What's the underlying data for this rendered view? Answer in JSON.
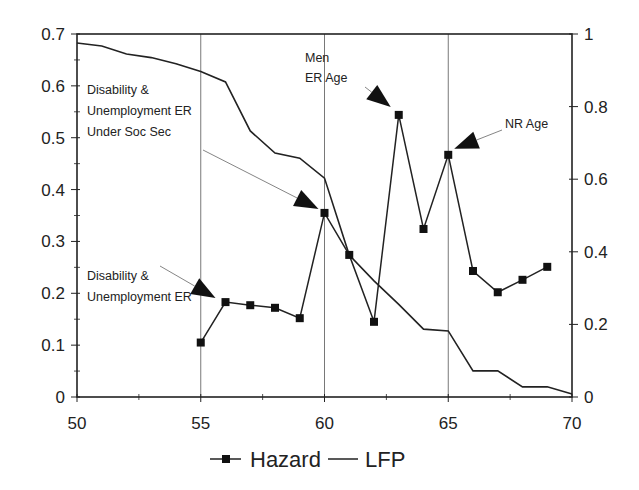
{
  "chart_data": {
    "type": "line",
    "title": "",
    "xlabel": "",
    "ylabel": "",
    "y2label": "",
    "xlim": [
      50,
      70
    ],
    "ylim": [
      0,
      0.7
    ],
    "y2lim": [
      0,
      1
    ],
    "grid": "vertical lines at 55, 60, 65",
    "x_ticks": [
      50,
      55,
      60,
      65,
      70
    ],
    "y_ticks": [
      0,
      0.1,
      0.2,
      0.3,
      0.4,
      0.5,
      0.6,
      0.7
    ],
    "y2_ticks": [
      0,
      0.2,
      0.4,
      0.6,
      0.8,
      1
    ],
    "x_tick_labels": [
      "50",
      "55",
      "60",
      "65",
      "70"
    ],
    "y_tick_labels": [
      "0",
      "0.1",
      "0.2",
      "0.3",
      "0.4",
      "0.5",
      "0.6",
      "0.7"
    ],
    "y2_tick_labels": [
      "0",
      "0.2",
      "0.4",
      "0.6",
      "0.8",
      "1"
    ],
    "legend_position": "bottom",
    "series": [
      {
        "name": "Hazard",
        "axis": "left",
        "marker": "square",
        "x": [
          55,
          56,
          57,
          58,
          59,
          60,
          61,
          62,
          63,
          64,
          65,
          66,
          67,
          68,
          69
        ],
        "values": [
          0.105,
          0.183,
          0.177,
          0.172,
          0.152,
          0.355,
          0.274,
          0.145,
          0.544,
          0.324,
          0.467,
          0.243,
          0.202,
          0.226,
          0.251
        ]
      },
      {
        "name": "LFP",
        "axis": "right",
        "marker": "none",
        "x": [
          50,
          51,
          52,
          53,
          54,
          55,
          56,
          57,
          58,
          59,
          60,
          61,
          62,
          63,
          64,
          65,
          66,
          67,
          68,
          69,
          70
        ],
        "values": [
          0.975,
          0.967,
          0.945,
          0.935,
          0.918,
          0.897,
          0.868,
          0.733,
          0.672,
          0.658,
          0.603,
          0.391,
          0.32,
          0.255,
          0.187,
          0.182,
          0.072,
          0.072,
          0.028,
          0.028,
          0.008
        ]
      }
    ],
    "annotations": [
      {
        "text": [
          "Disability &",
          "Unemployment ER",
          "Under Soc Sec"
        ],
        "target_x": 60,
        "target_series": "Hazard"
      },
      {
        "text": [
          "Disability &",
          "Unemployment ER"
        ],
        "target_x": 56,
        "target_series": "Hazard"
      },
      {
        "text": [
          "Men",
          "ER Age"
        ],
        "target_x": 63,
        "target_series": "Hazard"
      },
      {
        "text": [
          "NR Age"
        ],
        "target_x": 65,
        "target_series": "Hazard"
      }
    ]
  },
  "legend": {
    "hazard_label": "Hazard",
    "lfp_label": "LFP"
  }
}
